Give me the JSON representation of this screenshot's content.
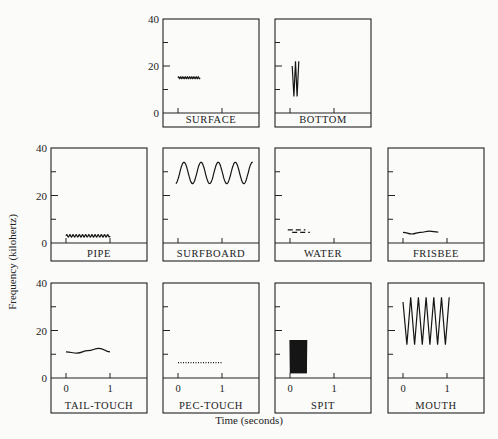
{
  "figure": {
    "ylabel": "Frequency (kilohertz)",
    "xlabel": "Time (seconds)"
  },
  "chart_data": {
    "type": "line",
    "title": "",
    "xlabel": "Time (seconds)",
    "ylabel": "Frequency (kilohertz)",
    "ylim": [
      0,
      40
    ],
    "yticks": [
      0,
      20,
      40
    ],
    "xticks": [
      0,
      1
    ],
    "grid": false,
    "legend": null,
    "panels": [
      {
        "name": "SURFACE",
        "row": 0,
        "col": 1,
        "shape": "flat-wavy",
        "t": [
          0,
          0.5
        ],
        "freq_khz": [
          15,
          15
        ],
        "amplitude_khz": 0.4,
        "cycles": 10
      },
      {
        "name": "BOTTOM",
        "row": 0,
        "col": 2,
        "shape": "zigzag",
        "t": [
          0.05,
          0.2
        ],
        "freq_range_khz": [
          7,
          22
        ],
        "peaks": 2
      },
      {
        "name": "PIPE",
        "row": 1,
        "col": 0,
        "shape": "flat-wavy",
        "t": [
          0,
          1
        ],
        "freq_khz": [
          3,
          3
        ],
        "amplitude_khz": 0.5,
        "cycles": 14
      },
      {
        "name": "SURFBOARD",
        "row": 1,
        "col": 1,
        "shape": "sine",
        "t": [
          -0.05,
          1.7
        ],
        "center_khz": 29.5,
        "amplitude_khz": 4.5,
        "cycles": 4.5
      },
      {
        "name": "WATER",
        "row": 1,
        "col": 2,
        "shape": "dashed-steps",
        "t": [
          -0.05,
          0.45
        ],
        "freq_khz": [
          5.5,
          4.5
        ]
      },
      {
        "name": "FRISBEE",
        "row": 1,
        "col": 3,
        "shape": "curve",
        "t": [
          0,
          0.8
        ],
        "freq_khz": [
          4.5,
          3.8,
          4.5,
          5.0,
          4.6
        ]
      },
      {
        "name": "TAIL-TOUCH",
        "row": 2,
        "col": 0,
        "shape": "curve",
        "t": [
          0,
          1
        ],
        "freq_khz": [
          11,
          10.5,
          11.5,
          12.5,
          11.0
        ]
      },
      {
        "name": "PEC-TOUCH",
        "row": 2,
        "col": 1,
        "shape": "dotted-line",
        "t": [
          0,
          1
        ],
        "freq_khz": [
          6.5,
          6.5
        ]
      },
      {
        "name": "SPIT",
        "row": 2,
        "col": 2,
        "shape": "dense-block",
        "t": [
          0,
          0.38
        ],
        "freq_range_khz": [
          2,
          16
        ]
      },
      {
        "name": "MOUTH",
        "row": 2,
        "col": 3,
        "shape": "zigzag",
        "t": [
          0,
          1.05
        ],
        "freq_range_khz": [
          14,
          34
        ],
        "peaks": 6
      }
    ]
  }
}
